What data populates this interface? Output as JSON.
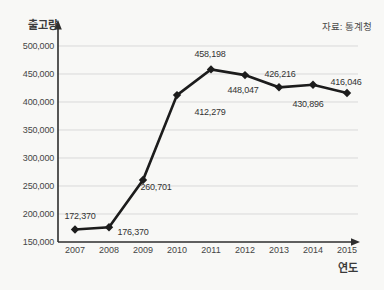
{
  "chart_data": {
    "type": "line",
    "title": "",
    "ylabel": "출고량",
    "xlabel": "연도",
    "source": "자료: 통계청",
    "categories": [
      "2007",
      "2008",
      "2009",
      "2010",
      "2011",
      "2012",
      "2013",
      "2014",
      "2015"
    ],
    "values": [
      172370,
      176370,
      260701,
      412279,
      458198,
      448047,
      426216,
      430896,
      416046
    ],
    "point_labels": [
      "172,370",
      "176,370",
      "260,701",
      "412,279",
      "458,198",
      "448,047",
      "426,216",
      "430,896",
      "416,046"
    ],
    "yticks": [
      "500,000",
      "450,000",
      "400,000",
      "350,000",
      "300,000",
      "250,000",
      "200,000",
      "150,000"
    ],
    "ylim": [
      150000,
      500000
    ],
    "ytick_step": 50000,
    "grid": "horizontal",
    "legend": "none",
    "marker": "diamond",
    "line_color": "#1c1c1c",
    "grid_color": "#d9d9d9",
    "axis_color": "#2e2e2e"
  }
}
